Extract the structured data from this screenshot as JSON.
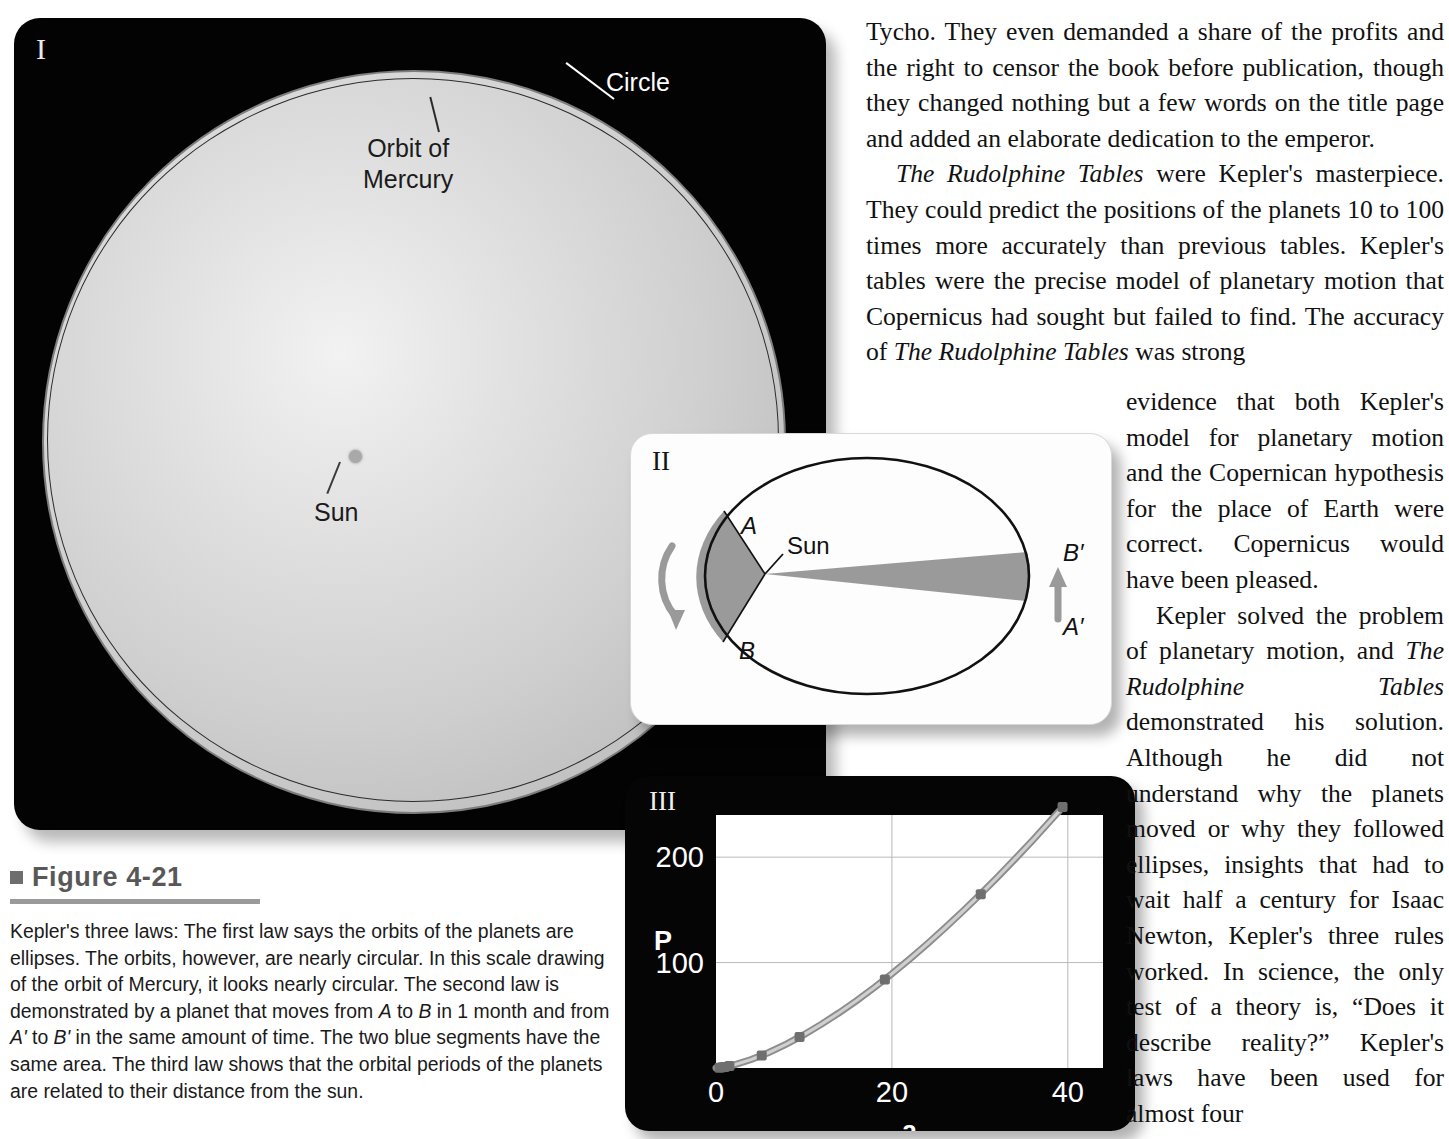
{
  "figure": {
    "bullet": "square-bullet",
    "title": "Figure 4-21",
    "caption_html": "Kepler's three laws: The first law says the orbits of the planets are ellipses. The orbits, however, are nearly circular. In this scale drawing of the orbit of Mercury, it looks nearly circular. The second law is demonstrated by a planet that moves from <i>A</i> to <i>B</i> in 1 month and from <i>A'</i> to <i>B'</i> in the same amount of time. The two blue segments have the same area. The third law shows that the orbital periods of the planets are related to their distance from the sun."
  },
  "panel1": {
    "numeral": "I",
    "label_circle": "Circle",
    "label_orbit_line1": "Orbit of",
    "label_orbit_line2": "Mercury",
    "label_sun": "Sun",
    "colors": {
      "background": "#030303",
      "disk": "#cfcfcf",
      "orbit_line": "#2b2b2b",
      "circle_line": "#7d7d7d"
    }
  },
  "panel2": {
    "numeral": "II",
    "label_A": "A",
    "label_B": "B",
    "label_Aprime": "A′",
    "label_Bprime": "B′",
    "label_sun": "Sun",
    "colors": {
      "background": "#fdfdfd",
      "ellipse_line": "#111111",
      "segment_fill": "#9a9a9a",
      "arrow": "#9a9a9a"
    }
  },
  "panel3": {
    "numeral": "III",
    "colors": {
      "background": "#050505",
      "plot_background": "#ffffff",
      "grid": "#b9b9b9",
      "curve": "#9b9b9b",
      "point": "#6f6f6f"
    }
  },
  "chart_data": {
    "type": "line",
    "title": "",
    "xlabel": "a",
    "ylabel": "P",
    "xlim": [
      0,
      44
    ],
    "ylim": [
      0,
      240
    ],
    "xticks": [
      0,
      20,
      40
    ],
    "xticklabels": [
      "0",
      "20",
      "40"
    ],
    "yticks": [
      100,
      200
    ],
    "yticklabels": [
      "100",
      "200"
    ],
    "grid": true,
    "legend": "none",
    "series": [
      {
        "name": "P = a^1.5",
        "x": [
          0,
          2,
          4,
          6,
          8,
          10,
          12,
          14,
          16,
          18,
          20,
          22,
          24,
          26,
          28,
          30,
          32,
          34,
          36,
          39
        ],
        "y": [
          0,
          2.8,
          8.0,
          14.7,
          22.6,
          31.6,
          41.6,
          52.4,
          64.0,
          76.4,
          89.4,
          103.2,
          117.6,
          132.6,
          148.2,
          164.3,
          181.0,
          198.3,
          216.0,
          243.6
        ]
      }
    ],
    "points": [
      {
        "label": "Mercury",
        "x": 0.39,
        "y": 0.24
      },
      {
        "label": "Venus",
        "x": 0.72,
        "y": 0.62
      },
      {
        "label": "Earth",
        "x": 1.0,
        "y": 1.0
      },
      {
        "label": "Mars",
        "x": 1.52,
        "y": 1.88
      },
      {
        "label": "Jupiter",
        "x": 5.2,
        "y": 11.9
      },
      {
        "label": "Saturn",
        "x": 9.5,
        "y": 29.5
      },
      {
        "label": "Uranus",
        "x": 19.2,
        "y": 84.0
      },
      {
        "label": "Neptune",
        "x": 30.1,
        "y": 164.8
      },
      {
        "label": "Pluto",
        "x": 39.4,
        "y": 247.7
      }
    ]
  },
  "text": {
    "wide_column": [
      {
        "indent": false,
        "html": "Tycho. They even demanded a share of the profits and the right to censor the book before publication, though they changed nothing but a few words on the title page and added an elaborate dedication to the emperor."
      },
      {
        "indent": true,
        "html": "<i>The Rudolphine Tables</i> were Kepler's masterpiece. They could predict the positions of the planets 10 to 100 times more accurately than previous tables. Kepler's tables were the precise model of planetary motion that Copernicus had sought but failed to find. The accuracy of <i>The Rudolphine Tables</i> was strong"
      }
    ],
    "narrow_column": [
      {
        "indent": false,
        "html": "evidence that both Kepler's model for planetary motion and the Copernican hypothesis for the place of Earth were correct. Copernicus would have been pleased."
      },
      {
        "indent": true,
        "html": "Kepler solved the problem of planetary motion, and <i>The Rudolphine Tables</i> demonstrated his solution. Although he did not understand why the planets moved or why they followed ellipses, insights that had to wait half a century for Isaac Newton, Kepler's three rules worked. In science, the only test of a theory is, &ldquo;Does it describe reality?&rdquo; Kepler's laws have been used for almost four"
      }
    ]
  }
}
